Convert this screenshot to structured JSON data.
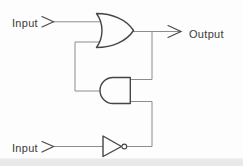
{
  "labels": {
    "input_top": "Input",
    "input_bottom": "Input",
    "output": "Output"
  },
  "gates": {
    "top": "or-gate",
    "middle": "and-gate-mirrored-left",
    "bottom": "not-gate-inverter"
  },
  "colors": {
    "background": "#fdfdfd",
    "wire": "#8c8c8c",
    "gate_stroke": "#454545",
    "arrow": "#4a4a4a",
    "text": "#3a3a3a",
    "bottom_shadow": "#e9e9e9"
  }
}
